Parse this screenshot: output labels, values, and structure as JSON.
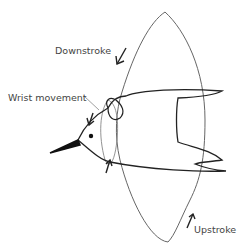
{
  "diagram": {
    "labels": {
      "downstroke": "Downstroke",
      "wrist_movement": "Wrist movement",
      "upstroke": "Upstroke"
    },
    "colors": {
      "line": "#555555",
      "bird": "#222222",
      "text": "#444444"
    }
  }
}
